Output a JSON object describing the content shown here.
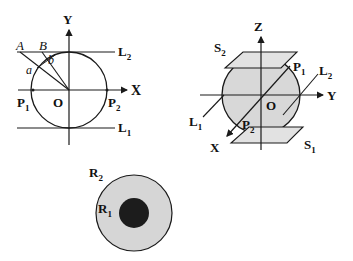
{
  "colors": {
    "stroke": "#1a1a1a",
    "sphere_fill": "#d8d8d8",
    "plane_fill": "#e2e2e2",
    "outer_disk_fill": "#d6d6d6",
    "inner_disk_fill": "#1c1c1c"
  },
  "figure_2d": {
    "y_axis_label": "Y",
    "x_axis_label": "X",
    "origin_label": "O",
    "line_top": {
      "main": "L",
      "sub": "2"
    },
    "line_bottom": {
      "main": "L",
      "sub": "1"
    },
    "point_left": {
      "main": "P",
      "sub": "1"
    },
    "point_right": {
      "main": "P",
      "sub": "2"
    },
    "point_A": "A",
    "point_B": "B",
    "angle_a": "a",
    "angle_b": "b"
  },
  "figure_3d": {
    "z_axis_label": "Z",
    "y_axis_label": "Y",
    "x_axis_label": "X",
    "origin_label": "O",
    "plane_top": {
      "main": "S",
      "sub": "2"
    },
    "plane_bottom": {
      "main": "S",
      "sub": "1"
    },
    "line_left": {
      "main": "L",
      "sub": "1"
    },
    "line_right": {
      "main": "L",
      "sub": "2"
    },
    "point_top": {
      "main": "P",
      "sub": "1"
    },
    "point_bottom": {
      "main": "P",
      "sub": "2"
    }
  },
  "figure_disk": {
    "outer_radius": {
      "main": "R",
      "sub": "2"
    },
    "inner_radius": {
      "main": "R",
      "sub": "1"
    }
  }
}
